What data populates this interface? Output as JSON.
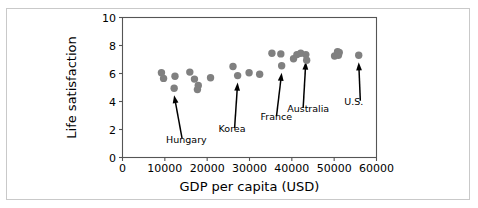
{
  "figure": {
    "background_color": "#ffffff",
    "border_color": "#c9c9c9",
    "axis_color": "#555555",
    "marker_color": "#808080",
    "text_color": "#000000",
    "top_fragment_left": "",
    "top_fragment_right": ""
  },
  "chart_data": {
    "type": "scatter",
    "title": "",
    "xlabel": "GDP per capita (USD)",
    "ylabel": "Life satisfaction",
    "xlim": [
      0,
      60000
    ],
    "ylim": [
      0,
      10
    ],
    "xticks": [
      0,
      10000,
      20000,
      30000,
      40000,
      50000,
      60000
    ],
    "xtick_labels": [
      "0",
      "10000",
      "20000",
      "30000",
      "40000",
      "50000",
      "60000"
    ],
    "yticks": [
      0,
      2,
      4,
      6,
      8,
      10
    ],
    "ytick_labels": [
      "0",
      "2",
      "4",
      "6",
      "8",
      "10"
    ],
    "grid": false,
    "legend": null,
    "marker_size": 5,
    "marker_color": "#808080",
    "points": [
      {
        "x": 9200,
        "y": 6.05
      },
      {
        "x": 9700,
        "y": 5.65
      },
      {
        "x": 12400,
        "y": 5.8
      },
      {
        "x": 12200,
        "y": 4.95
      },
      {
        "x": 15900,
        "y": 6.1
      },
      {
        "x": 17000,
        "y": 5.6
      },
      {
        "x": 17900,
        "y": 5.15
      },
      {
        "x": 17700,
        "y": 4.85
      },
      {
        "x": 20800,
        "y": 5.7
      },
      {
        "x": 26100,
        "y": 6.5
      },
      {
        "x": 27200,
        "y": 5.85
      },
      {
        "x": 29900,
        "y": 6.05
      },
      {
        "x": 32400,
        "y": 5.95
      },
      {
        "x": 35300,
        "y": 7.45
      },
      {
        "x": 37400,
        "y": 7.4
      },
      {
        "x": 37600,
        "y": 6.55
      },
      {
        "x": 40400,
        "y": 7.05
      },
      {
        "x": 41200,
        "y": 7.35
      },
      {
        "x": 42100,
        "y": 7.45
      },
      {
        "x": 43300,
        "y": 7.35
      },
      {
        "x": 43500,
        "y": 6.95
      },
      {
        "x": 50100,
        "y": 7.25
      },
      {
        "x": 50800,
        "y": 7.55
      },
      {
        "x": 51200,
        "y": 7.5
      },
      {
        "x": 51000,
        "y": 7.3
      },
      {
        "x": 55800,
        "y": 7.3
      }
    ],
    "annotations": [
      {
        "label": "Hungary",
        "point_x": 12200,
        "point_y": 4.95,
        "text_x": 10300,
        "text_y": 1.35
      },
      {
        "label": "Korea",
        "point_x": 27200,
        "point_y": 5.85,
        "text_x": 22700,
        "text_y": 2.1
      },
      {
        "label": "France",
        "point_x": 37600,
        "point_y": 6.55,
        "text_x": 32600,
        "text_y": 2.95
      },
      {
        "label": "Australia",
        "point_x": 43300,
        "point_y": 7.35,
        "text_x": 38900,
        "text_y": 3.55
      },
      {
        "label": "U.S.",
        "point_x": 55800,
        "point_y": 7.3,
        "text_x": 52400,
        "text_y": 4.05
      }
    ]
  }
}
